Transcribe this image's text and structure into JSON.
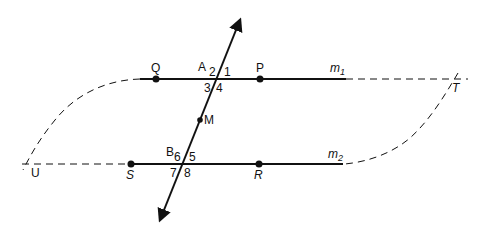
{
  "diagram": {
    "title": "",
    "lines": {
      "m1": {
        "label": "m",
        "subscript": "1"
      },
      "m2": {
        "label": "m",
        "subscript": "2"
      }
    },
    "points": {
      "Q": "Q",
      "P": "P",
      "A": "A",
      "M": "M",
      "B": "B",
      "S": "S",
      "R": "R",
      "T": "T",
      "U": "U"
    },
    "angles": {
      "a1": "1",
      "a2": "2",
      "a3": "3",
      "a4": "4",
      "a5": "5",
      "a6": "6",
      "a7": "7",
      "a8": "8"
    },
    "colors": {
      "stroke": "#111111",
      "background": "#ffffff"
    }
  }
}
